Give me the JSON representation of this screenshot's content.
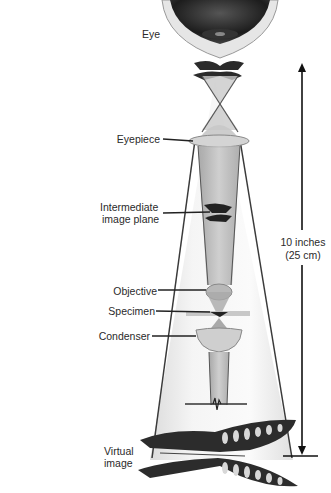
{
  "diagram": {
    "labels": {
      "eye": "Eye",
      "eyepiece": "Eyepiece",
      "intermediate_line1": "Intermediate",
      "intermediate_line2": "image plane",
      "objective": "Objective",
      "specimen": "Specimen",
      "condenser": "Condenser",
      "distance_line1": "10 inches",
      "distance_line2": "(25 cm)",
      "virtual_line1": "Virtual",
      "virtual_line2": "image"
    },
    "colors": {
      "cone_fill": "#ececec",
      "beam_fill": "#b9b9b9",
      "lines": "#3a3a3a",
      "text": "#2a2a2a"
    }
  }
}
